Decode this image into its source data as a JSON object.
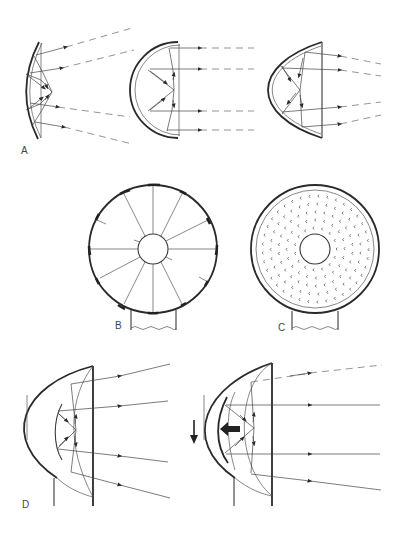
{
  "figure": {
    "panels": [
      {
        "id": "A",
        "label": "A",
        "description": "Three reflector profiles (shallow dish, hemisphere, parabolic) with incoming and reflected rays"
      },
      {
        "id": "B",
        "label": "B",
        "description": "Front view of segmented reflector dish with radial ribs and central hub on stand"
      },
      {
        "id": "C",
        "label": "C",
        "description": "Front view of perforated reflector dish with central hub on stand"
      },
      {
        "id": "D",
        "label": "D",
        "description": "Parabolic housing with inner reflector; second view shows inner reflector moved back (arrow)"
      }
    ],
    "colors": {
      "ink": "#2a2a2a",
      "background": "#ffffff"
    }
  }
}
